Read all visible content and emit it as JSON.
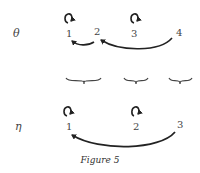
{
  "figure": {
    "caption": "Figure 5",
    "rows": [
      {
        "label": "θ",
        "nodes": [
          "1",
          "2",
          "3",
          "4"
        ],
        "self_loops": [
          "1",
          "3"
        ],
        "arrows": [
          {
            "from": "2",
            "to": "1"
          },
          {
            "from": "4",
            "to": "2"
          }
        ]
      },
      {
        "label": "η",
        "nodes": [
          "1",
          "2",
          "3"
        ],
        "self_loops": [
          "1",
          "2"
        ],
        "arrows": [
          {
            "from": "3",
            "to": "1"
          }
        ]
      }
    ],
    "groupings": [
      {
        "covers": [
          "1",
          "2"
        ],
        "maps_to": "1"
      },
      {
        "covers": [
          "3"
        ],
        "maps_to": "2"
      },
      {
        "covers": [
          "4"
        ],
        "maps_to": "3"
      }
    ]
  }
}
